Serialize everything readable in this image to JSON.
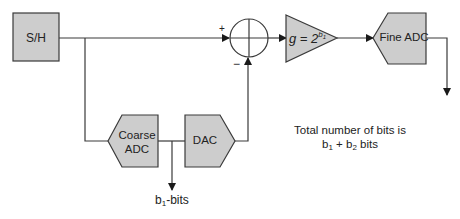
{
  "diagram": {
    "type": "block-diagram",
    "colors": {
      "block_fill": "#cdcdcd",
      "stroke": "#3a3a3a",
      "text": "#222222",
      "background": "#ffffff"
    },
    "blocks": {
      "sample_hold": {
        "label": "S/H"
      },
      "summer": {
        "plus_sign": "+",
        "minus_sign": "−"
      },
      "gain": {
        "label_prefix": "g = 2",
        "exp_base": "b",
        "exp_sub": "1"
      },
      "fine_adc": {
        "label": "Fine ADC"
      },
      "coarse_adc": {
        "line1": "Coarse",
        "line2": "ADC"
      },
      "dac": {
        "label": "DAC"
      }
    },
    "outputs": {
      "coarse_bits": {
        "base": "b",
        "sub": "1",
        "suffix": "-bits"
      }
    },
    "note": {
      "line1": "Total number of bits is",
      "b1": "b",
      "b1_sub": "1",
      "plus": " + ",
      "b2": "b",
      "b2_sub": "2",
      "suffix": " bits"
    }
  }
}
